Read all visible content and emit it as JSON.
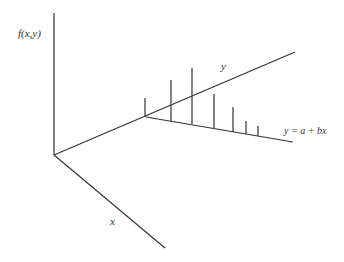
{
  "diagram": {
    "labels": {
      "z_axis": "f(x,y)",
      "y_axis": "y",
      "x_axis": "x",
      "regression": "y = a + bx"
    },
    "colors": {
      "line": "#333333",
      "background": "#ffffff"
    },
    "axes": {
      "origin": [
        54,
        155
      ],
      "z_top": [
        54,
        13
      ],
      "x_end": [
        165,
        248
      ],
      "y_end": [
        295,
        52
      ]
    },
    "regression_line": {
      "start": [
        146,
        117
      ],
      "end": [
        293,
        142
      ]
    },
    "spikes": [
      {
        "x": 145,
        "base": 117,
        "top": 98
      },
      {
        "x": 171,
        "base": 121,
        "top": 80
      },
      {
        "x": 192,
        "base": 124,
        "top": 68
      },
      {
        "x": 214,
        "base": 128,
        "top": 94
      },
      {
        "x": 233,
        "base": 132,
        "top": 107
      },
      {
        "x": 246,
        "base": 134,
        "top": 121
      },
      {
        "x": 258,
        "base": 136,
        "top": 126
      }
    ]
  }
}
